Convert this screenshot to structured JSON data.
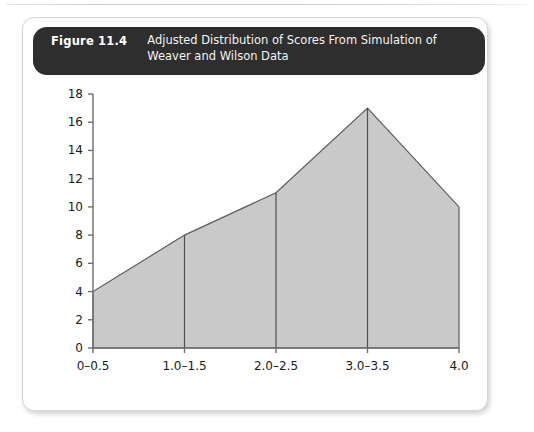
{
  "figure": {
    "number_label": "Figure 11.4",
    "title": "Adjusted Distribution of Scores From Simulation of Weaver and Wilson Data",
    "caption_bar_color": "#2e2e2e",
    "card_background": "#ffffff"
  },
  "chart_data": {
    "type": "area",
    "title": "Adjusted Distribution of Scores From Simulation of Weaver and Wilson Data",
    "categories": [
      "0–0.5",
      "1.0–1.5",
      "2.0–2.5",
      "3.0–3.5",
      "4.0"
    ],
    "values": [
      4,
      8,
      11,
      17,
      10
    ],
    "xlabel": "",
    "ylabel": "",
    "ylim": [
      0,
      18
    ],
    "y_ticks": [
      0,
      2,
      4,
      6,
      8,
      10,
      12,
      14,
      16,
      18
    ],
    "y_tick_labels": [
      "0",
      "2",
      "4",
      "6",
      "8",
      "10",
      "12",
      "14",
      "16",
      "18"
    ],
    "x_tick_labels": [
      "0–0.5",
      "1.0–1.5",
      "2.0–2.5",
      "3.0–3.5",
      "4.0"
    ],
    "grid": false,
    "legend": null,
    "fill_color": "#c9c9c9",
    "line_color": "#5d5d5d",
    "axis_color": "#6e6e6e",
    "divider_color": "#4f4f4f"
  }
}
